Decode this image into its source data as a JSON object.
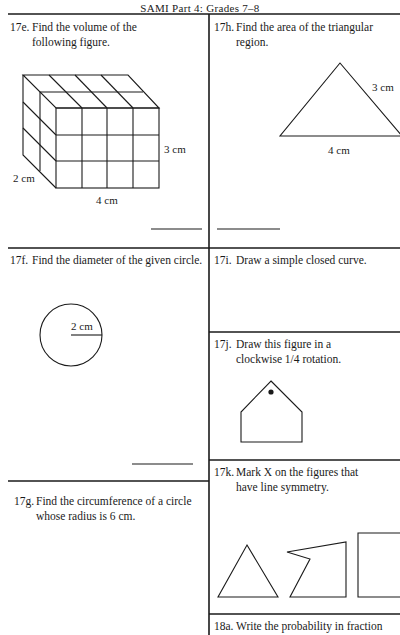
{
  "header": {
    "title": "SAMI Part 4: Grades 7–8"
  },
  "questions": {
    "q17e": {
      "number": "17e.",
      "line1": "Find the volume of the",
      "line2": "following figure.",
      "labels": {
        "height": "3 cm",
        "depth": "2 cm",
        "width": "4 cm"
      }
    },
    "q17h": {
      "number": "17h.",
      "line1": "Find the area of the triangular",
      "line2": "region.",
      "labels": {
        "side": "3 cm",
        "base": "4 cm"
      }
    },
    "q17f": {
      "number": "17f.",
      "line1": "Find the diameter of the given circle.",
      "labels": {
        "radius": "2 cm"
      }
    },
    "q17g": {
      "number": "17g.",
      "line1": "Find the circumference of a circle",
      "line2": "whose radius is 6 cm."
    },
    "q17i": {
      "number": "17i.",
      "line1": "Draw a simple closed curve."
    },
    "q17j": {
      "number": "17j.",
      "line1": "Draw this figure in a",
      "line2": "clockwise 1/4 rotation."
    },
    "q17k": {
      "number": "17k.",
      "line1": "Mark X on the figures that",
      "line2": "have line symmetry."
    },
    "q18a": {
      "number": "18a.",
      "line1": "Write the probability in fraction"
    }
  }
}
